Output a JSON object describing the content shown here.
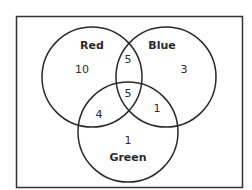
{
  "diagram": {
    "type": "venn",
    "sets": [
      {
        "name": "Red",
        "label": "Red"
      },
      {
        "name": "Blue",
        "label": "Blue"
      },
      {
        "name": "Green",
        "label": "Green"
      }
    ],
    "regions": {
      "red_only": "10",
      "blue_only": "3",
      "green_only": "1",
      "red_blue": "5",
      "red_green": "4",
      "blue_green": "1",
      "red_blue_green": "5"
    },
    "colors": {
      "stroke": "#2a2a2a",
      "background": "#ffffff"
    }
  }
}
